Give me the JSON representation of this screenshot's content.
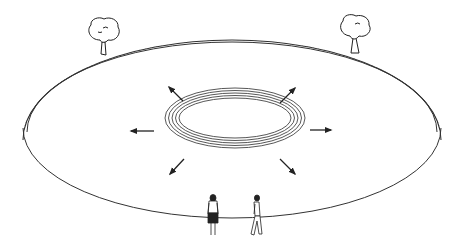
{
  "illustration": {
    "title": "",
    "description": "Elevated circular enclosure with wall, two trees on the rim, concentric rings in the center with eight outward arrows, and two people standing at the near edge",
    "colors": {
      "background": "#ffffff",
      "line": "#222222",
      "ring": "#444444"
    },
    "elements": {
      "enclosure": {
        "cx": 232,
        "cy": 128,
        "rx": 209,
        "ry": 90,
        "wall_height": 12
      },
      "center_rings": {
        "cx": 235,
        "cy": 118,
        "count": 5,
        "rx_start": 56,
        "ry_start": 20,
        "step": 3.5
      },
      "arrows": [
        {
          "direction": "up-left"
        },
        {
          "direction": "up-right"
        },
        {
          "direction": "left"
        },
        {
          "direction": "right"
        },
        {
          "direction": "down-left"
        },
        {
          "direction": "down-right"
        }
      ],
      "trees": [
        {
          "position": "rim-left"
        },
        {
          "position": "rim-right"
        }
      ],
      "people": [
        {
          "description": "woman in skirt, facing away"
        },
        {
          "description": "man walking"
        }
      ]
    }
  }
}
